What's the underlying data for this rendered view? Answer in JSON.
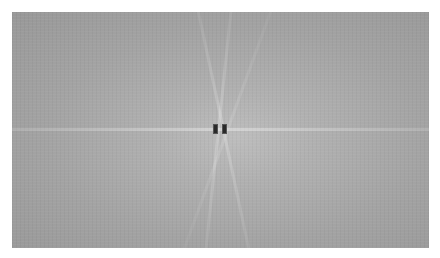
{
  "player": {
    "state": "paused",
    "overlay_icon": "pause-icon",
    "frame_colors": {
      "center": "#bdbdbd",
      "edge": "#989898",
      "icon": "#2a2a2a"
    }
  }
}
